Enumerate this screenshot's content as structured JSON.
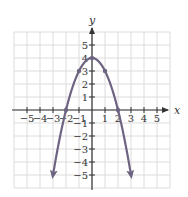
{
  "chart_data": {
    "type": "line",
    "title": "",
    "xlabel": "x",
    "ylabel": "y",
    "xlim": [
      -6,
      6
    ],
    "ylim": [
      -6,
      6
    ],
    "grid": true,
    "x_ticks": [
      -5,
      -4,
      -3,
      -2,
      -1,
      1,
      2,
      3,
      4,
      5
    ],
    "y_ticks": [
      -5,
      -4,
      -3,
      -2,
      -1,
      1,
      2,
      3,
      4,
      5
    ],
    "x_tick_labels": [
      "−5",
      "−4",
      "−3",
      "−2",
      "−1",
      "1",
      "2",
      "3",
      "4",
      "5"
    ],
    "y_tick_labels": [
      "−5",
      "−4",
      "−3",
      "−2",
      "−1",
      "1",
      "2",
      "3",
      "4",
      "5"
    ],
    "series": [
      {
        "name": "parabola",
        "equation": "y = 4 - x^2",
        "color": "#6e6482",
        "x_range": [
          -3,
          3
        ],
        "arrows_at_ends": true,
        "marked_points": [
          {
            "x": -2,
            "y": 0
          },
          {
            "x": -1,
            "y": 3
          },
          {
            "x": 0,
            "y": 4
          },
          {
            "x": 1,
            "y": 3
          },
          {
            "x": 2,
            "y": 0
          }
        ]
      }
    ]
  },
  "layout": {
    "origin_px": [
      92,
      110
    ],
    "unit_px": 13,
    "grid_color": "#dcdcdc",
    "axis_color": "#333333"
  }
}
